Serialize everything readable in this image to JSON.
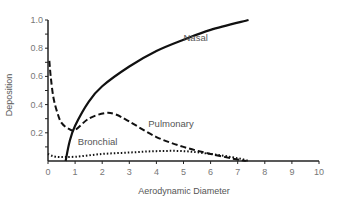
{
  "chart_data": {
    "type": "line",
    "title": "",
    "xlabel": "Aerodynamic Diameter",
    "ylabel": "Deposition",
    "xlim": [
      0,
      10
    ],
    "ylim": [
      0,
      1.0
    ],
    "xticks": [
      0,
      1,
      2,
      3,
      4,
      5,
      6,
      7,
      8,
      9,
      10
    ],
    "yticks": [
      0.2,
      0.4,
      0.6,
      0.8,
      1.0
    ],
    "ytick_labels": [
      "0.2",
      "0.4",
      "0.6",
      "0.8",
      "1.0"
    ],
    "grid": false,
    "legend": "inline curve labels",
    "series": [
      {
        "name": "Nasal",
        "style": "solid",
        "x": [
          0.65,
          0.8,
          1.0,
          1.5,
          2.0,
          3.0,
          4.0,
          5.0,
          6.0,
          7.4
        ],
        "y": [
          0.0,
          0.14,
          0.25,
          0.42,
          0.53,
          0.67,
          0.78,
          0.86,
          0.93,
          1.0
        ],
        "label_pos": [
          5.0,
          0.85
        ]
      },
      {
        "name": "Pulmonary",
        "style": "dashed",
        "x": [
          0.05,
          0.1,
          0.2,
          0.35,
          0.5,
          0.75,
          1.0,
          1.5,
          2.1,
          2.5,
          3.0,
          4.0,
          5.0,
          6.0,
          7.0,
          7.3
        ],
        "y": [
          0.71,
          0.6,
          0.45,
          0.34,
          0.27,
          0.23,
          0.22,
          0.3,
          0.34,
          0.33,
          0.28,
          0.17,
          0.1,
          0.05,
          0.01,
          0.0
        ],
        "label_pos": [
          3.7,
          0.24
        ]
      },
      {
        "name": "Bronchial",
        "style": "dotted",
        "x": [
          0.0,
          0.3,
          1.0,
          2.0,
          3.0,
          4.0,
          5.0,
          6.0,
          7.0,
          7.4
        ],
        "y": [
          0.05,
          0.03,
          0.03,
          0.05,
          0.06,
          0.07,
          0.07,
          0.05,
          0.02,
          0.0
        ],
        "label_pos": [
          1.1,
          0.11
        ]
      }
    ]
  }
}
